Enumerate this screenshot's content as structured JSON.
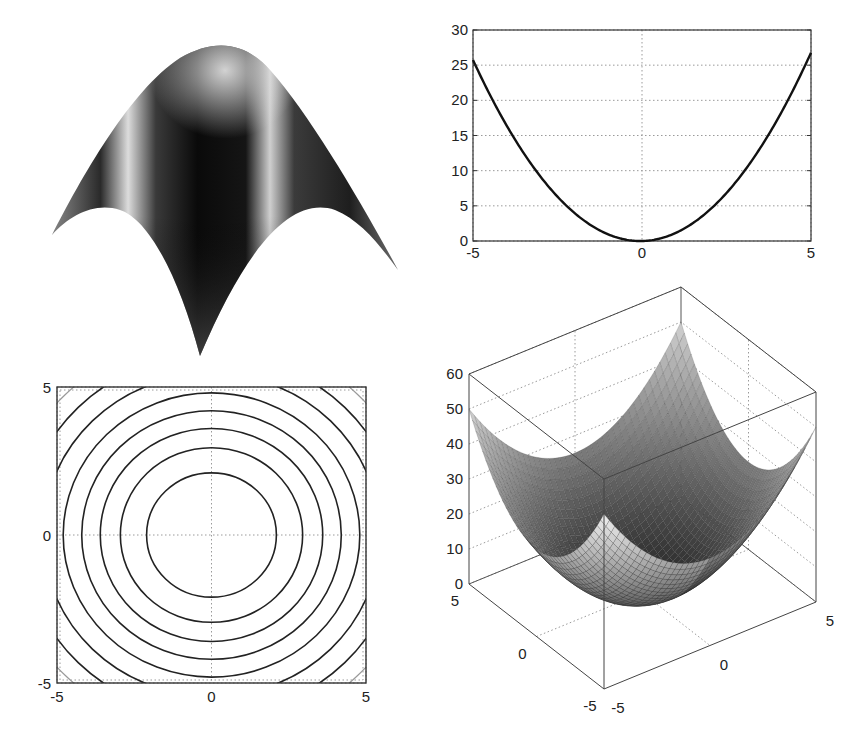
{
  "figure": {
    "layout": "2x2 subplots",
    "background": "#ffffff",
    "ink": "#1a1a1a",
    "grid_color": "#9a9a9a"
  },
  "chart_data": [
    {
      "id": "surface-shaded",
      "type": "surface",
      "position": "top-left",
      "description": "Shaded 3D surface of an inverted paraboloid z = -(x^2 + y^2), axes hidden, viewed from below-front",
      "function": "z = -(x^2 + y^2)",
      "x_range": [
        -5,
        5
      ],
      "y_range": [
        -5,
        5
      ],
      "axes_visible": false,
      "shading": "interp, dark with specular highlights",
      "colors": {
        "dark": "#0b0b0b",
        "mid": "#4a4a4a",
        "highlight": "#d8d8d8"
      }
    },
    {
      "id": "parabola-line",
      "type": "line",
      "position": "top-right",
      "function": "y = x^2",
      "title": "",
      "xlabel": "",
      "ylabel": "",
      "xlim": [
        -5,
        5
      ],
      "ylim": [
        0,
        30
      ],
      "xticks": [
        -5,
        0,
        5
      ],
      "yticks": [
        0,
        5,
        10,
        15,
        20,
        25,
        30
      ],
      "grid": true,
      "x": [
        -5,
        -4,
        -3,
        -2,
        -1,
        0,
        1,
        2,
        3,
        4,
        5
      ],
      "values": [
        25,
        16,
        9,
        4,
        1,
        0,
        1,
        4,
        9,
        16,
        25
      ],
      "line_color": "#111111"
    },
    {
      "id": "contour-plot",
      "type": "contour",
      "position": "bottom-left",
      "function": "z = x^2 + y^2",
      "xlim": [
        -5,
        5
      ],
      "ylim": [
        -5,
        5
      ],
      "xticks": [
        -5,
        0,
        5
      ],
      "yticks": [
        -5,
        0,
        5
      ],
      "grid": true,
      "contour_radii": [
        2.1,
        2.95,
        3.6,
        4.2,
        4.8,
        5.45,
        6.1,
        6.7
      ],
      "contour_levels_approx": [
        4.4,
        8.7,
        13,
        17.6,
        23,
        29.7,
        37.2,
        44.9
      ],
      "line_color": "#222222",
      "outer_line_color": "#9a9a9a"
    },
    {
      "id": "mesh-3d",
      "type": "surface",
      "position": "bottom-right",
      "function": "z = x^2 + y^2",
      "x_range": [
        -5,
        5
      ],
      "y_range": [
        -5,
        5
      ],
      "zlim": [
        0,
        60
      ],
      "xticks": [
        -5,
        0,
        5
      ],
      "yticks": [
        -5,
        0,
        5
      ],
      "zticks": [
        0,
        10,
        20,
        30,
        40,
        50,
        60
      ],
      "grid": true,
      "box": true,
      "shading": "grayscale mesh, darker near the minimum"
    }
  ],
  "plots": {
    "top_right": {
      "xtick_labels": [
        "-5",
        "0",
        "5"
      ],
      "ytick_labels": [
        "0",
        "5",
        "10",
        "15",
        "20",
        "25",
        "30"
      ]
    },
    "bottom_left": {
      "xtick_labels": [
        "-5",
        "0",
        "5"
      ],
      "ytick_labels": [
        "-5",
        "0",
        "5"
      ]
    },
    "bottom_right": {
      "ztick_labels": [
        "0",
        "10",
        "20",
        "30",
        "40",
        "50",
        "60"
      ],
      "ytick_labels_left": [
        "5",
        "0",
        "-5"
      ],
      "xtick_labels_right": [
        "-5",
        "0",
        "5"
      ]
    }
  }
}
